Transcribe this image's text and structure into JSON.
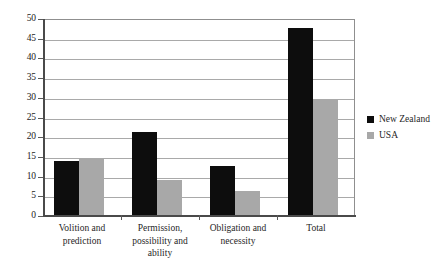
{
  "chart_data": {
    "type": "bar",
    "title": "",
    "subtitle": "",
    "xlabel": "",
    "ylabel": "",
    "ylim": [
      0,
      50
    ],
    "yticks": [
      0,
      5,
      10,
      15,
      20,
      25,
      30,
      35,
      40,
      45,
      50
    ],
    "ytick_labels": [
      "0",
      "5",
      "10",
      "15",
      "20",
      "25",
      "30",
      "35",
      "40",
      "45",
      "50"
    ],
    "grid": true,
    "legend_position": "right",
    "categories": [
      "Volition and prediction",
      "Permission, possibility and ability",
      "Obligation and necessity",
      "Total"
    ],
    "category_label_lines": [
      [
        "Volition and",
        "prediction"
      ],
      [
        "Permission,",
        "possibility and",
        "ability"
      ],
      [
        "Obligation and",
        "necessity"
      ],
      [
        "Total"
      ]
    ],
    "series": [
      {
        "name": "New Zealand",
        "color": "#0d0d0d",
        "values": [
          13.7,
          21.0,
          12.4,
          47.5
        ]
      },
      {
        "name": "USA",
        "color": "#a8a8a8",
        "values": [
          14.3,
          8.8,
          6.2,
          29.3
        ]
      }
    ]
  },
  "legend": {
    "items": [
      {
        "label": "New Zealand",
        "color": "#0d0d0d"
      },
      {
        "label": "USA",
        "color": "#a8a8a8"
      }
    ]
  }
}
